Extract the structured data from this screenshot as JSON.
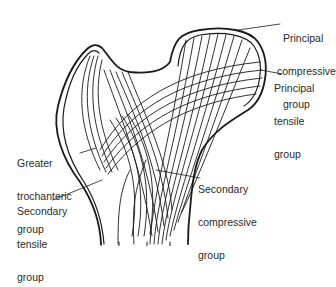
{
  "diagram": {
    "labels": {
      "principal_compressive": {
        "line1": "Principal",
        "line2": "compressive",
        "line3": "group"
      },
      "principal_tensile": {
        "line1": "Principal",
        "line2": "tensile",
        "line3": "group"
      },
      "greater_trochanteric": {
        "line1": "Greater",
        "line2": "trochanteric",
        "line3": "group"
      },
      "secondary_compressive": {
        "line1": "Secondary",
        "line2": "compressive",
        "line3": "group"
      },
      "secondary_tensile": {
        "line1": "Secondary",
        "line2": "tensile",
        "line3": "group"
      }
    },
    "colors": {
      "ink": "#1a1a1a",
      "text": "#2a2a2a",
      "background": "#ffffff"
    }
  }
}
